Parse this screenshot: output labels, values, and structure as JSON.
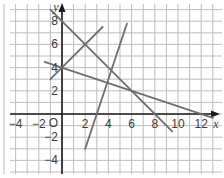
{
  "chart_data": {
    "type": "line",
    "title": "",
    "xlabel": "x",
    "ylabel": "y",
    "xlim": [
      -5,
      14
    ],
    "ylim": [
      -5,
      10
    ],
    "grid": true,
    "origin_label": "O",
    "x_ticks": [
      -4,
      -2,
      2,
      4,
      6,
      8,
      10,
      12
    ],
    "y_ticks": [
      8,
      6,
      4,
      2,
      -2,
      -4
    ],
    "series": [
      {
        "name": "y = 8 - x",
        "points": [
          [
            -1,
            9
          ],
          [
            9.5,
            -1.5
          ]
        ]
      },
      {
        "name": "y = x + 4",
        "points": [
          [
            -1,
            3
          ],
          [
            3.5,
            7.5
          ]
        ]
      },
      {
        "name": "y = 4 - x/3",
        "points": [
          [
            -1.5,
            4.5
          ],
          [
            13,
            -0.33
          ]
        ]
      },
      {
        "name": "y = 3x - 9",
        "points": [
          [
            2,
            -3
          ],
          [
            5.6,
            7.8
          ]
        ]
      }
    ],
    "intersections": [
      [
        0,
        4
      ],
      [
        2,
        6
      ],
      [
        6,
        2
      ],
      [
        12,
        0
      ],
      [
        8,
        0
      ]
    ]
  },
  "colors": {
    "grid": "#bdbdbd",
    "axis": "#1a1a1a",
    "line": "#6e6e6e"
  }
}
